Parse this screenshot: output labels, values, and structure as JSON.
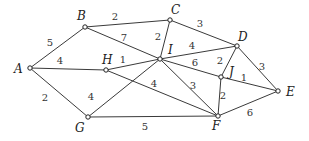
{
  "graph": {
    "nodes": [
      {
        "id": "A",
        "label": "A",
        "x": 30,
        "y": 68,
        "lx": 14,
        "ly": 73
      },
      {
        "id": "B",
        "label": "B",
        "x": 85,
        "y": 27,
        "lx": 77,
        "ly": 20
      },
      {
        "id": "C",
        "label": "C",
        "x": 170,
        "y": 20,
        "lx": 171,
        "ly": 14
      },
      {
        "id": "D",
        "label": "D",
        "x": 237,
        "y": 46,
        "lx": 238,
        "ly": 41
      },
      {
        "id": "E",
        "label": "E",
        "x": 278,
        "y": 91,
        "lx": 286,
        "ly": 96
      },
      {
        "id": "F",
        "label": "F",
        "x": 218,
        "y": 116,
        "lx": 212,
        "ly": 130
      },
      {
        "id": "G",
        "label": "G",
        "x": 88,
        "y": 117,
        "lx": 75,
        "ly": 132
      },
      {
        "id": "H",
        "label": "H",
        "x": 106,
        "y": 70,
        "lx": 102,
        "ly": 64
      },
      {
        "id": "I",
        "label": "I",
        "x": 160,
        "y": 59,
        "lx": 168,
        "ly": 54
      },
      {
        "id": "J",
        "label": "J",
        "x": 221,
        "y": 77,
        "lx": 229,
        "ly": 76
      }
    ],
    "edges": [
      {
        "from": "A",
        "to": "B",
        "weight": "5",
        "lx": 50,
        "ly": 46
      },
      {
        "from": "A",
        "to": "H",
        "weight": "4",
        "lx": 60,
        "ly": 64
      },
      {
        "from": "A",
        "to": "G",
        "weight": "2",
        "lx": 45,
        "ly": 101
      },
      {
        "from": "B",
        "to": "C",
        "weight": "2",
        "lx": 115,
        "ly": 20
      },
      {
        "from": "B",
        "to": "I",
        "weight": "7",
        "lx": 124,
        "ly": 41
      },
      {
        "from": "C",
        "to": "I",
        "weight": "2",
        "lx": 158,
        "ly": 40
      },
      {
        "from": "C",
        "to": "D",
        "weight": "3",
        "lx": 200,
        "ly": 27
      },
      {
        "from": "I",
        "to": "D",
        "weight": "4",
        "lx": 192,
        "ly": 49
      },
      {
        "from": "H",
        "to": "I",
        "weight": "1",
        "lx": 123,
        "ly": 63
      },
      {
        "from": "I",
        "to": "J",
        "weight": "6",
        "lx": 195,
        "ly": 66
      },
      {
        "from": "J",
        "to": "E",
        "weight": "1",
        "lx": 244,
        "ly": 81
      },
      {
        "from": "D",
        "to": "J",
        "weight": "2",
        "lx": 220,
        "ly": 64
      },
      {
        "from": "D",
        "to": "E",
        "weight": "3",
        "lx": 262,
        "ly": 70
      },
      {
        "from": "H",
        "to": "F",
        "weight": "4",
        "lx": 154,
        "ly": 87
      },
      {
        "from": "G",
        "to": "I",
        "weight": "4",
        "lx": 91,
        "ly": 100
      },
      {
        "from": "I",
        "to": "F",
        "weight": "3",
        "lx": 193,
        "ly": 89
      },
      {
        "from": "J",
        "to": "F",
        "weight": "2",
        "lx": 223,
        "ly": 99
      },
      {
        "from": "G",
        "to": "F",
        "weight": "5",
        "lx": 145,
        "ly": 130
      },
      {
        "from": "F",
        "to": "E",
        "weight": "6",
        "lx": 250,
        "ly": 116
      }
    ]
  }
}
